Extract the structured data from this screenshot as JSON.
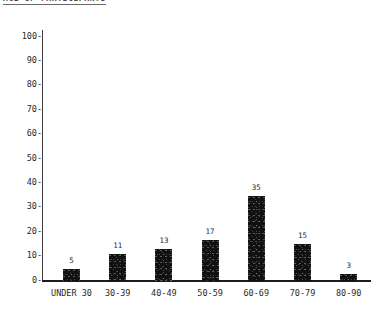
{
  "chart_data": {
    "type": "bar",
    "title": "AGE OF PARTICIPANTS",
    "xlabel": "",
    "ylabel": "",
    "categories": [
      "UNDER 30",
      "30-39",
      "40-49",
      "50-59",
      "60-69",
      "70-79",
      "80-90"
    ],
    "values": [
      5,
      11,
      13,
      17,
      35,
      15,
      3
    ],
    "data_labels": [
      "5",
      "11",
      "13",
      "17",
      "35",
      "15",
      "3"
    ],
    "ylim": [
      0,
      100
    ],
    "ytick_values": [
      100,
      90,
      80,
      70,
      60,
      50,
      40,
      30,
      20,
      10,
      0
    ],
    "ytick_labels": [
      "100",
      "90",
      "80",
      "70",
      "60",
      "50",
      "40",
      "30",
      "20",
      "10",
      "0"
    ],
    "ytick_dash": "-",
    "grid": false,
    "legend": false,
    "bar_color": "#111111",
    "axis_color": "#1c1c1c",
    "background_color": "#ffffff"
  }
}
